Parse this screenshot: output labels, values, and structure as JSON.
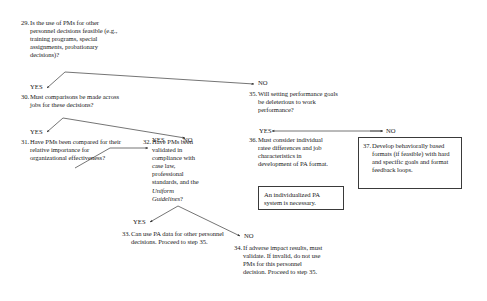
{
  "diagram": {
    "line_color": "#2a2a2a",
    "box_border_color": "#3a3a3a",
    "background": "#ffffff"
  },
  "nodes": {
    "n29": {
      "number": "29.",
      "text": "Is the use of PMs for other personnel decisions feasible (e.g., training programs, special assignments, probationary decisions)?"
    },
    "n30": {
      "number": "30.",
      "text": "Must comparisons be made across jobs for these decisions?"
    },
    "n31": {
      "number": "31.",
      "text": "Have PMs been compared for their relative importance for organizational effectiveness?"
    },
    "n32": {
      "number": "32.",
      "text_part1": "Have PMs been validated in compliance with case law, professional standards, and the ",
      "text_italic": "Uniform Guidelines",
      "text_part2": "?"
    },
    "n33": {
      "number": "33.",
      "text": "Can use PA data for other personnel decisions. Proceed to step 35."
    },
    "n34": {
      "number": "34.",
      "text": "If adverse impact results, must validate. If invalid, do not use PMs for this personnel decision. Proceed to step 35."
    },
    "n35": {
      "number": "35.",
      "text": "Will setting performance goals be deleterious to work performance?"
    },
    "n36": {
      "number": "36.",
      "text": "Must consider individual ratee differences and job characteristics in development of PA format."
    },
    "n37": {
      "number": "37.",
      "text": "Develop behaviorally based formats (if feasible) with hard and specific goals and format feedback loops."
    },
    "note_individualized": {
      "text": "An individualized PA system is necessary."
    }
  },
  "branch_labels": {
    "l29_yes": "YES",
    "l29_no": "NO",
    "l30_yes": "YES",
    "l30_no": "NO",
    "l31_yes": "YES",
    "l32_yes": "YES",
    "l32_no": "NO",
    "l35_yes": "YES",
    "l35_no": "NO"
  }
}
